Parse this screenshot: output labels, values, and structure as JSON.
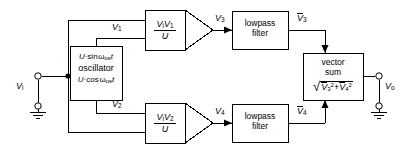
{
  "diagram": {
    "line_color": "#000000",
    "background": "#ffffff"
  },
  "terminals": {
    "input": {
      "label_v": "V",
      "label_sub": "i",
      "name": "input-terminal"
    },
    "output": {
      "label_v": "V",
      "label_sub": "o",
      "name": "output-terminal"
    }
  },
  "blocks": {
    "multiplier_top": {
      "numerator_v1": "V",
      "numerator_v1_sub": "i",
      "numerator_v2": "V",
      "numerator_v2_sub": "1",
      "denominator": "U"
    },
    "multiplier_bottom": {
      "numerator_v1": "V",
      "numerator_v1_sub": "i",
      "numerator_v2": "V",
      "numerator_v2_sub": "2",
      "denominator": "U"
    },
    "oscillator": {
      "line1_amp": "U",
      "line1_dot": "·",
      "line1_fn": "sin",
      "line1_omega": "ω",
      "line1_sub": "os",
      "line1_t": "t",
      "line2": "oscillator",
      "line3_amp": "U",
      "line3_dot": "·",
      "line3_fn": "cos",
      "line3_omega": "ω",
      "line3_sub": "os",
      "line3_t": "t"
    },
    "lowpass_top": {
      "line1": "lowpass",
      "line2": "filter"
    },
    "lowpass_bottom": {
      "line1": "lowpass",
      "line2": "filter"
    },
    "vector_sum": {
      "line1": "vector",
      "line2": "sum",
      "radical": "√",
      "term1_v": "V",
      "term1_sub": "3",
      "term1_sup": "2",
      "plus": "+",
      "term2_v": "V",
      "term2_sub": "4",
      "term2_sup": "2"
    }
  },
  "signals": {
    "v1": {
      "v": "V",
      "sub": "1"
    },
    "v2": {
      "v": "V",
      "sub": "2"
    },
    "v3": {
      "v": "V",
      "sub": "3"
    },
    "v4": {
      "v": "V",
      "sub": "4"
    },
    "v3bar": {
      "v": "V",
      "sub": "3"
    },
    "v4bar": {
      "v": "V",
      "sub": "4"
    }
  }
}
